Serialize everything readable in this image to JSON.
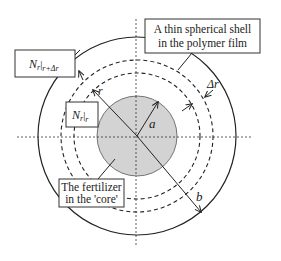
{
  "diagram": {
    "type": "cross-section",
    "colors": {
      "stroke": "#222222",
      "core_fill": "#d3d3d3",
      "background": "#ffffff"
    },
    "labels": {
      "shell_box_line1": "A thin spherical shell",
      "shell_box_line2": "in the polymer film",
      "flux_outer_N": "N",
      "flux_outer_sub_r": "r",
      "flux_outer_eval": "r+Δr",
      "flux_inner_N": "N",
      "flux_inner_sub_r": "r",
      "flux_inner_eval": "r",
      "core_box_line1": "The fertilizer",
      "core_box_line2": "in the 'core'",
      "radius_r": "r",
      "radius_a": "a",
      "radius_b": "b",
      "delta_r": "Δr"
    },
    "geometry": {
      "center": [
        137,
        136
      ],
      "core_radius": 40,
      "inner_dashed_radius": 63,
      "outer_dashed_radius": 76,
      "outer_radius": 99
    }
  }
}
